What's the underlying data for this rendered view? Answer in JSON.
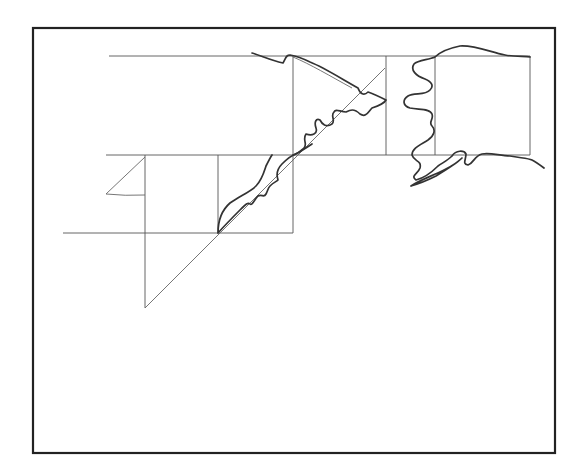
{
  "diagram": {
    "colors": {
      "background": "#ffffff",
      "frame": "#222222",
      "grid": "#555555",
      "outline": "#333333"
    },
    "frame": {
      "x": 33,
      "y": 28,
      "width": 522,
      "height": 425
    },
    "grid_lines": {
      "horizontal": [
        {
          "y": 56,
          "x1": 109,
          "x2": 530
        },
        {
          "y": 155,
          "x1": 106,
          "x2": 530
        },
        {
          "y": 233,
          "x1": 63,
          "x2": 293
        }
      ],
      "vertical": [
        {
          "x": 145,
          "y1": 155,
          "y2": 308
        },
        {
          "x": 218,
          "y1": 155,
          "y2": 233
        },
        {
          "x": 293,
          "y1": 56,
          "y2": 233
        },
        {
          "x": 386,
          "y1": 56,
          "y2": 155
        },
        {
          "x": 435,
          "y1": 56,
          "y2": 155
        },
        {
          "x": 530,
          "y1": 56,
          "y2": 155
        }
      ]
    },
    "diagonal": {
      "x1": 145,
      "y1": 308,
      "x2": 385,
      "y2": 68
    },
    "labels": []
  }
}
